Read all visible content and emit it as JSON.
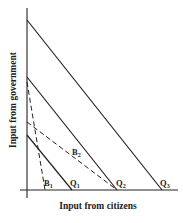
{
  "diagram": {
    "x_axis_label": "Input from citizens",
    "y_axis_label": "Input from government",
    "colors": {
      "line": "#222222",
      "background": "#ffffff"
    },
    "isoquants": [
      {
        "id": "Q1",
        "label": "Q",
        "sub": "1",
        "style": "solid",
        "from": [
          27,
          135
        ],
        "to": [
          72,
          190
        ]
      },
      {
        "id": "Q2",
        "label": "Q",
        "sub": "2",
        "style": "solid",
        "from": [
          27,
          77
        ],
        "to": [
          117,
          190
        ]
      },
      {
        "id": "Q3",
        "label": "Q",
        "sub": "3",
        "style": "solid",
        "from": [
          27,
          20
        ],
        "to": [
          162,
          190
        ]
      }
    ],
    "budget_lines": [
      {
        "id": "B1",
        "label": "B",
        "sub": "1",
        "style": "dashed",
        "from": [
          27,
          82
        ],
        "to": [
          45,
          190
        ]
      },
      {
        "id": "B2",
        "label": "B",
        "sub": "2",
        "style": "dashed",
        "from": [
          27,
          122
        ],
        "to": [
          117,
          190
        ]
      }
    ]
  }
}
